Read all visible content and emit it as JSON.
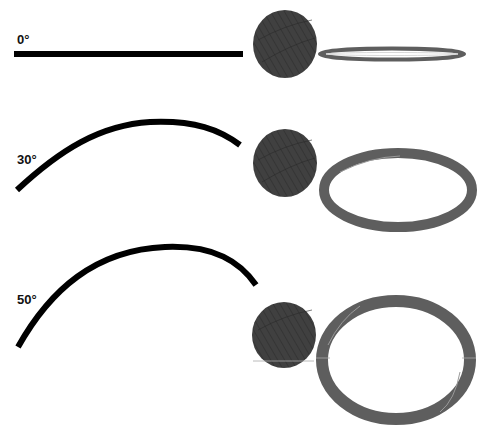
{
  "diagram": {
    "colors": {
      "strip": "#000000",
      "sphere": "#3f3f3f",
      "sphere_texture": "#2c2c2c",
      "ring": "#5e5e5e",
      "ring_highlight": "#9a9a9a",
      "background": "#ffffff"
    },
    "rows": [
      {
        "label": "0°",
        "angle": 0
      },
      {
        "label": "30°",
        "angle": 30
      },
      {
        "label": "50°",
        "angle": 50
      }
    ]
  }
}
